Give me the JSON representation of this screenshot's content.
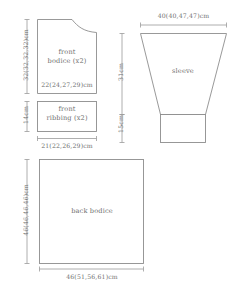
{
  "diagram": {
    "unit": "cm",
    "line_color": "#8d8d8d",
    "text_color": "#6f6f6f",
    "background_color": "#ffffff"
  },
  "pieces": {
    "front_bodice": {
      "label_line1": "front",
      "label_line2": "bodice (x2)",
      "width_inside": "22(24,27,29)cm",
      "height_bracket": "32(32,32,32)cm"
    },
    "front_ribbing": {
      "label_line1": "front",
      "label_line2": "ribbing (x2)",
      "height_bracket": "14cm",
      "width_below": "21(22,26,29)cm"
    },
    "sleeve": {
      "label": "sleeve",
      "top_width": "40(40,47,47)cm",
      "body_height": "31cm",
      "cuff_height": "15cm"
    },
    "back_bodice": {
      "label": "back bodice",
      "height_bracket": "46(46,46,46)cm",
      "width_below": "46(51,56,61)cm"
    }
  }
}
